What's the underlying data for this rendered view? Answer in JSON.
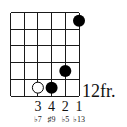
{
  "diagram": {
    "type": "guitar-chord-diagram",
    "strings": 6,
    "frets_shown": 5,
    "start_fret_label": "12fr.",
    "grid": {
      "left": 10.5,
      "top": 12.5,
      "string_spacing": 13.7,
      "fret_spacing": 16.7
    },
    "colors": {
      "line": "#1a1a1a",
      "dot": "#000000",
      "open_dot_fill": "#ffffff"
    },
    "notes": [
      {
        "string": 6,
        "fret_row": 1,
        "style": "filled",
        "finger": "1",
        "interval": "♭13"
      },
      {
        "string": 5,
        "fret_row": 4,
        "style": "filled",
        "finger": "2",
        "interval": "♭5"
      },
      {
        "string": 4,
        "fret_row": 5,
        "style": "filled",
        "finger": "4",
        "interval": "♯9"
      },
      {
        "string": 3,
        "fret_row": 5,
        "style": "open",
        "finger": "3",
        "interval": "♭7"
      }
    ],
    "finger_labels": [
      {
        "string": 3,
        "text": "3"
      },
      {
        "string": 4,
        "text": "4"
      },
      {
        "string": 5,
        "text": "2"
      },
      {
        "string": 6,
        "text": "1"
      }
    ],
    "interval_labels": [
      {
        "string": 3,
        "text": "♭7"
      },
      {
        "string": 4,
        "text": "♯9"
      },
      {
        "string": 5,
        "text": "♭5"
      },
      {
        "string": 6,
        "text": "♭13"
      }
    ]
  }
}
